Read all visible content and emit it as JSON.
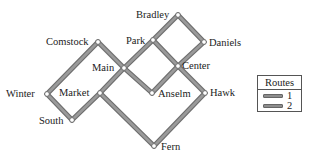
{
  "diagram": {
    "type": "route-map",
    "nodes": [
      {
        "id": "bradley",
        "label": "Bradley",
        "x": 178,
        "y": 15,
        "label_x": 136,
        "label_y": 18,
        "anchor": "start"
      },
      {
        "id": "park",
        "label": "Park",
        "x": 153,
        "y": 40,
        "label_x": 126,
        "label_y": 44,
        "anchor": "start"
      },
      {
        "id": "daniels",
        "label": "Daniels",
        "x": 204,
        "y": 42,
        "label_x": 209,
        "label_y": 46,
        "anchor": "start"
      },
      {
        "id": "comstock",
        "label": "Comstock",
        "x": 98,
        "y": 42,
        "label_x": 46,
        "label_y": 45,
        "anchor": "start"
      },
      {
        "id": "main",
        "label": "Main",
        "x": 124,
        "y": 68,
        "label_x": 92,
        "label_y": 71,
        "anchor": "start"
      },
      {
        "id": "center",
        "label": "Center",
        "x": 178,
        "y": 66,
        "label_x": 182,
        "label_y": 69,
        "anchor": "start"
      },
      {
        "id": "winter",
        "label": "Winter",
        "x": 47,
        "y": 94,
        "label_x": 6,
        "label_y": 97,
        "anchor": "start"
      },
      {
        "id": "market",
        "label": "Market",
        "x": 100,
        "y": 93,
        "label_x": 59,
        "label_y": 96,
        "anchor": "start"
      },
      {
        "id": "anselm",
        "label": "Anselm",
        "x": 152,
        "y": 93,
        "label_x": 158,
        "label_y": 97,
        "anchor": "start"
      },
      {
        "id": "hawk",
        "label": "Hawk",
        "x": 205,
        "y": 93,
        "label_x": 210,
        "label_y": 96,
        "anchor": "start"
      },
      {
        "id": "south",
        "label": "South",
        "x": 72,
        "y": 120,
        "label_x": 39,
        "label_y": 124,
        "anchor": "start"
      },
      {
        "id": "fern",
        "label": "Fern",
        "x": 154,
        "y": 146,
        "label_x": 161,
        "label_y": 150,
        "anchor": "start"
      }
    ],
    "edges": [
      {
        "from": "winter",
        "to": "comstock"
      },
      {
        "from": "comstock",
        "to": "main"
      },
      {
        "from": "main",
        "to": "anselm"
      },
      {
        "from": "anselm",
        "to": "center"
      },
      {
        "from": "winter",
        "to": "south"
      },
      {
        "from": "south",
        "to": "market"
      },
      {
        "from": "market",
        "to": "main"
      },
      {
        "from": "main",
        "to": "park"
      },
      {
        "from": "park",
        "to": "bradley"
      },
      {
        "from": "bradley",
        "to": "daniels"
      },
      {
        "from": "daniels",
        "to": "center"
      },
      {
        "from": "park",
        "to": "center"
      },
      {
        "from": "center",
        "to": "hawk"
      },
      {
        "from": "market",
        "to": "fern"
      },
      {
        "from": "fern",
        "to": "hawk"
      }
    ]
  },
  "legend": {
    "title": "Routes",
    "items": [
      {
        "label": "1",
        "color": "#8d8d8d"
      },
      {
        "label": "2",
        "color": "#8d8d8d"
      }
    ]
  },
  "colors": {
    "line_fill": "#9a9a9a",
    "line_outline": "#6e6e6e",
    "node_fill": "#ffffff",
    "text": "#222222"
  }
}
